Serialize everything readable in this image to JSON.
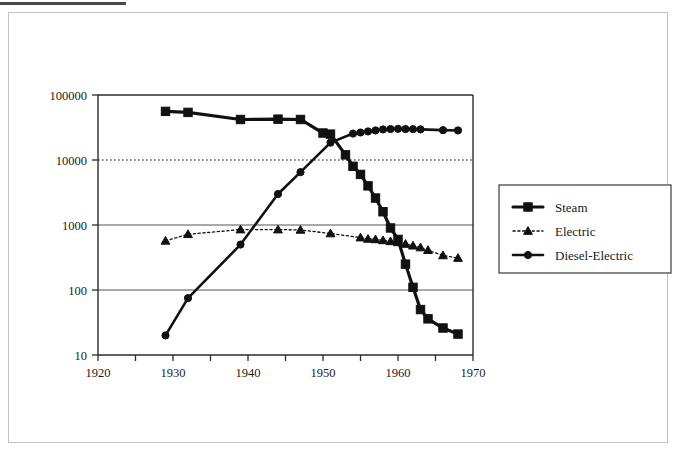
{
  "page": {
    "background_color": "#ffffff",
    "frame_color": "#c2c2c2",
    "top_rule_color": "#4a4a4a"
  },
  "chart_data": {
    "type": "line",
    "title": "",
    "subtitle": "",
    "xlabel": "",
    "ylabel": "",
    "yscale": "log",
    "xlim": [
      1920,
      1970
    ],
    "ylim": [
      10,
      100000
    ],
    "xticks": [
      1920,
      1925,
      1930,
      1935,
      1940,
      1945,
      1950,
      1955,
      1960,
      1965,
      1970
    ],
    "xtick_labels": [
      "1920",
      "",
      "1930",
      "",
      "1940",
      "",
      "1950",
      "",
      "1960",
      "",
      "1970"
    ],
    "yticks": [
      10,
      100,
      1000,
      10000,
      100000
    ],
    "ytick_labels": [
      "10",
      "100",
      "1000",
      "10000",
      "100000"
    ],
    "grid": {
      "horizontal": [
        {
          "value": 100,
          "style": "solid",
          "color": "#555555"
        },
        {
          "value": 1000,
          "style": "solid",
          "color": "#555555"
        },
        {
          "value": 10000,
          "style": "dotted",
          "color": "#1a1a1a"
        }
      ],
      "vertical": []
    },
    "legend": {
      "position": "right",
      "entries": [
        "Steam",
        "Electric",
        "Diesel-Electric"
      ]
    },
    "series": [
      {
        "name": "Steam",
        "marker": "square",
        "line_style": "solid",
        "line_width": 3.2,
        "color": "#111111",
        "x": [
          1929,
          1932,
          1939,
          1944,
          1947,
          1950,
          1951,
          1953,
          1954,
          1955,
          1956,
          1957,
          1958,
          1959,
          1960,
          1961,
          1962,
          1963,
          1964,
          1966,
          1968
        ],
        "values": [
          56000,
          54000,
          42000,
          42500,
          42000,
          26000,
          25000,
          12000,
          8000,
          6000,
          4000,
          2600,
          1600,
          900,
          600,
          250,
          110,
          50,
          36,
          26,
          21
        ]
      },
      {
        "name": "Electric",
        "marker": "triangle",
        "line_style": "dotted",
        "line_width": 1.3,
        "color": "#111111",
        "x": [
          1929,
          1932,
          1939,
          1944,
          1947,
          1951,
          1955,
          1956,
          1957,
          1958,
          1959,
          1960,
          1961,
          1962,
          1963,
          1964,
          1966,
          1968
        ],
        "values": [
          570,
          720,
          850,
          850,
          840,
          740,
          640,
          610,
          600,
          580,
          560,
          540,
          510,
          480,
          450,
          410,
          340,
          310
        ]
      },
      {
        "name": "Diesel-Electric",
        "marker": "circle",
        "line_style": "solid",
        "line_width": 2.6,
        "color": "#111111",
        "x": [
          1929,
          1932,
          1939,
          1944,
          1947,
          1951,
          1954,
          1955,
          1956,
          1957,
          1958,
          1959,
          1960,
          1961,
          1962,
          1963,
          1966,
          1968
        ],
        "values": [
          20,
          75,
          500,
          3000,
          6500,
          18500,
          25500,
          26500,
          27500,
          28500,
          29500,
          30000,
          30200,
          30000,
          29800,
          29600,
          28800,
          28500
        ]
      }
    ]
  }
}
